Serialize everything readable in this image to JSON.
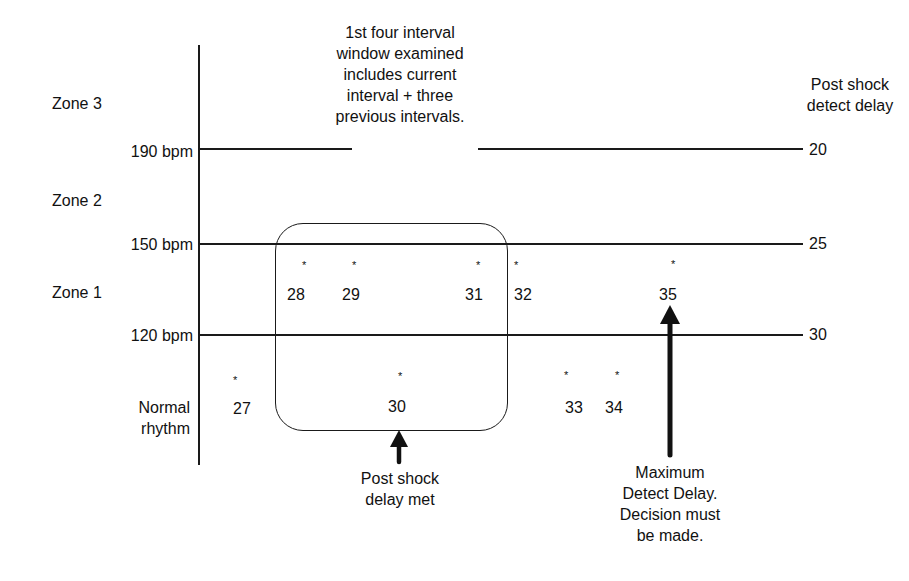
{
  "annotation_top": [
    "1st four interval",
    "window examined",
    "includes current",
    "interval + three",
    "previous intervals."
  ],
  "right_axis_title": [
    "Post shock",
    "detect delay"
  ],
  "zones": {
    "zone3": "Zone 3",
    "zone2": "Zone 2",
    "zone1": "Zone 1",
    "normal": [
      "Normal",
      "rhythm"
    ]
  },
  "thresholds": [
    {
      "label": "190 bpm",
      "delay": "20"
    },
    {
      "label": "150 bpm",
      "delay": "25"
    },
    {
      "label": "120 bpm",
      "delay": "30"
    }
  ],
  "intervals": [
    {
      "id": "27",
      "zone": "normal"
    },
    {
      "id": "28",
      "zone": "zone1"
    },
    {
      "id": "29",
      "zone": "zone1"
    },
    {
      "id": "30",
      "zone": "normal"
    },
    {
      "id": "31",
      "zone": "zone1"
    },
    {
      "id": "32",
      "zone": "zone1"
    },
    {
      "id": "33",
      "zone": "normal"
    },
    {
      "id": "34",
      "zone": "normal"
    },
    {
      "id": "35",
      "zone": "zone1"
    }
  ],
  "star_glyph": "*",
  "callouts": {
    "post_shock": [
      "Post shock",
      "delay met"
    ],
    "max_delay": [
      "Maximum",
      "Detect Delay.",
      "Decision must",
      "be made."
    ]
  }
}
